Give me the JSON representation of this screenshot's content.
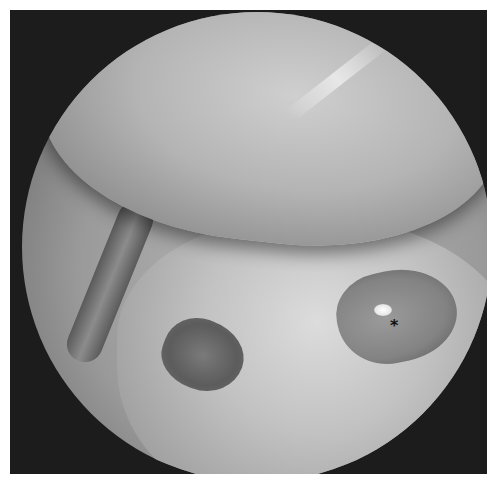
{
  "image": {
    "kind": "grayscale endoscopic view",
    "background_color": "#1c1c1c",
    "field_of_view": "circular"
  },
  "annotations": [
    {
      "label": "*",
      "color": "#111111"
    }
  ]
}
